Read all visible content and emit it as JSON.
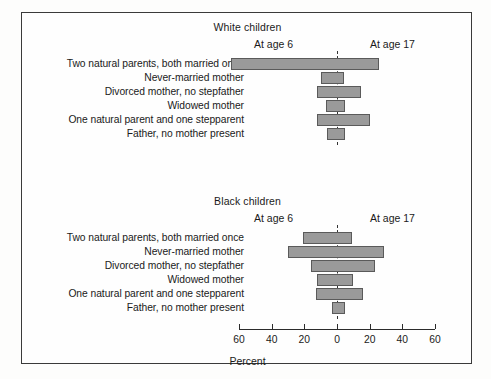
{
  "figure": {
    "categories": [
      "Two natural parents, both married once",
      "Never-married mother",
      "Divorced mother, no stepfather",
      "Widowed mother",
      "One natural parent and one stepparent",
      "Father, no mother present"
    ],
    "left_series_label": "At age 6",
    "right_series_label": "At age 17",
    "axis_title": "Percent",
    "tick_labels": [
      "60",
      "40",
      "20",
      "0",
      "20",
      "40",
      "60"
    ],
    "panels": [
      {
        "title": "White children"
      },
      {
        "title": "Black children"
      }
    ]
  },
  "chart_data": {
    "type": "bar",
    "title": "",
    "subtitle": "",
    "orientation": "horizontal",
    "layout": "two stacked butterfly (back-to-back) panels sharing one x axis",
    "xlabel": "Percent",
    "ylabel": "",
    "xlim": [
      -60,
      60
    ],
    "xticks": [
      -60,
      -40,
      -20,
      0,
      20,
      40,
      60
    ],
    "xtick_labels": [
      "60",
      "40",
      "20",
      "0",
      "20",
      "40",
      "60"
    ],
    "grid": false,
    "legend": "inline text labels above axis: 'At age 6' on the left half, 'At age 17' on the right half",
    "annotations": [
      "dashed vertical reference line at 0 percent in each panel"
    ],
    "categories": [
      "Two natural parents, both married once",
      "Never-married mother",
      "Divorced mother, no stepfather",
      "Widowed mother",
      "One natural parent and one stepparent",
      "Father, no mother present"
    ],
    "panels": [
      {
        "name": "White children",
        "series": [
          {
            "name": "At age 6",
            "side": "left",
            "values": [
              65,
              10,
              12,
              7,
              12,
              6
            ]
          },
          {
            "name": "At age 17",
            "side": "right",
            "values": [
              26,
              4,
              15,
              5,
              20,
              5
            ]
          }
        ]
      },
      {
        "name": "Black children",
        "series": [
          {
            "name": "At age 6",
            "side": "left",
            "values": [
              21,
              30,
              16,
              12,
              13,
              3
            ]
          },
          {
            "name": "At age 17",
            "side": "right",
            "values": [
              9,
              29,
              23,
              10,
              16,
              5
            ]
          }
        ]
      }
    ]
  }
}
